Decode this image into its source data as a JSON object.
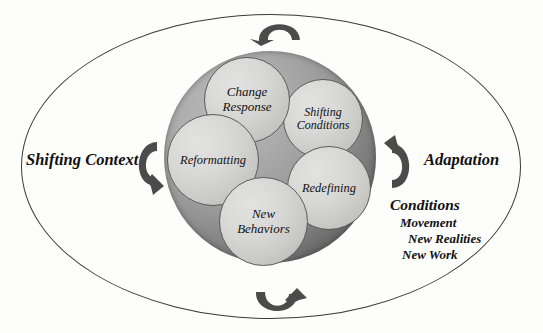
{
  "diagram": {
    "title_present": false,
    "outer_ellipse": {
      "name": "outer-boundary-ellipse",
      "stroke_color": "#3a3a3a"
    },
    "sphere": {
      "name": "central-sphere",
      "light_color": "#b9b9b9",
      "dark_color": "#4a4a4a"
    },
    "nodes": [
      {
        "id": "change-response",
        "line1": "Change",
        "line2": "Response"
      },
      {
        "id": "shifting-conditions",
        "line1": "Shifting",
        "line2": "Conditions"
      },
      {
        "id": "reformatting",
        "line1": "Reformatting",
        "line2": ""
      },
      {
        "id": "redefining",
        "line1": "Redefining",
        "line2": ""
      },
      {
        "id": "new-behaviors",
        "line1": "New",
        "line2": "Behaviors"
      }
    ],
    "left_label": "Shifting Context",
    "right_label": "Adaptation",
    "conditions": {
      "heading": "Conditions",
      "items": [
        "Movement",
        "New Realities",
        "New Work"
      ]
    },
    "arrows": [
      {
        "id": "arrow-top",
        "icon": "rotate-arrow-down-left-icon",
        "color": "#4b4b4b"
      },
      {
        "id": "arrow-bottom",
        "icon": "rotate-arrow-up-right-icon",
        "color": "#4b4b4b"
      },
      {
        "id": "arrow-left",
        "icon": "rotate-arrow-clockwise-icon",
        "color": "#4b4b4b"
      },
      {
        "id": "arrow-right",
        "icon": "rotate-arrow-counterclockwise-icon",
        "color": "#4b4b4b"
      }
    ],
    "text_color": "#111111"
  }
}
